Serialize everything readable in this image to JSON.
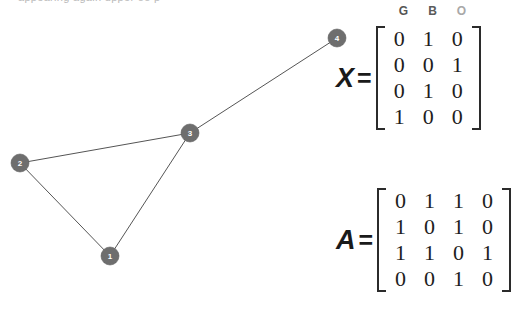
{
  "page": {
    "background": "#ffffff",
    "top_cropped_text": "appearing again upper oo p"
  },
  "graph": {
    "node_fill": "#6e6e6e",
    "node_label_color": "#ffffff",
    "edge_color": "#555555",
    "node_radius": 9,
    "nodes": [
      {
        "id": "1",
        "label": "1",
        "cx": 110,
        "cy": 256
      },
      {
        "id": "2",
        "label": "2",
        "cx": 20,
        "cy": 163
      },
      {
        "id": "3",
        "label": "3",
        "cx": 190,
        "cy": 133
      },
      {
        "id": "4",
        "label": "4",
        "cx": 337,
        "cy": 38
      }
    ],
    "edges": [
      {
        "from": "2",
        "to": "3",
        "x1": 20,
        "y1": 163,
        "x2": 190,
        "y2": 133
      },
      {
        "from": "2",
        "to": "1",
        "x1": 20,
        "y1": 163,
        "x2": 110,
        "y2": 256
      },
      {
        "from": "1",
        "to": "3",
        "x1": 110,
        "y1": 256,
        "x2": 190,
        "y2": 133
      },
      {
        "from": "3",
        "to": "4",
        "x1": 190,
        "y1": 133,
        "x2": 337,
        "y2": 38
      }
    ]
  },
  "feature_headers": [
    {
      "label": "G",
      "color": "#545454"
    },
    {
      "label": "B",
      "color": "#5a5a5a"
    },
    {
      "label": "O",
      "color": "#a8a8a8"
    }
  ],
  "matrix_x": {
    "name": "X",
    "equals": "=",
    "rows": [
      [
        "0",
        "1",
        "0"
      ],
      [
        "0",
        "0",
        "1"
      ],
      [
        "0",
        "1",
        "0"
      ],
      [
        "1",
        "0",
        "0"
      ]
    ]
  },
  "matrix_a": {
    "name": "A",
    "equals": "=",
    "rows": [
      [
        "0",
        "1",
        "1",
        "0"
      ],
      [
        "1",
        "0",
        "1",
        "0"
      ],
      [
        "1",
        "1",
        "0",
        "1"
      ],
      [
        "0",
        "0",
        "1",
        "0"
      ]
    ]
  }
}
